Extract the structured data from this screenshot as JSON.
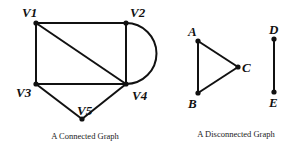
{
  "figure": {
    "connected": {
      "caption": "A Connected Graph",
      "nodes": [
        {
          "id": "V1",
          "label": "V1",
          "x": 36,
          "y": 23
        },
        {
          "id": "V2",
          "label": "V2",
          "x": 126,
          "y": 23
        },
        {
          "id": "V3",
          "label": "V3",
          "x": 36,
          "y": 84
        },
        {
          "id": "V4",
          "label": "V4",
          "x": 126,
          "y": 84
        },
        {
          "id": "V5",
          "label": "V5",
          "x": 82,
          "y": 119
        }
      ],
      "edges": [
        [
          "V1",
          "V2"
        ],
        [
          "V1",
          "V3"
        ],
        [
          "V1",
          "V4"
        ],
        [
          "V2",
          "V4"
        ],
        [
          "V2",
          "V4 (curved)"
        ],
        [
          "V3",
          "V4"
        ],
        [
          "V3",
          "V5"
        ],
        [
          "V4",
          "V5"
        ]
      ]
    },
    "disconnected": {
      "caption": "A Disconnected Graph",
      "nodes": [
        {
          "id": "A",
          "label": "A",
          "x": 198,
          "y": 41
        },
        {
          "id": "B",
          "label": "B",
          "x": 198,
          "y": 93
        },
        {
          "id": "C",
          "label": "C",
          "x": 238,
          "y": 67
        },
        {
          "id": "D",
          "label": "D",
          "x": 274,
          "y": 39
        },
        {
          "id": "E",
          "label": "E",
          "x": 274,
          "y": 92
        }
      ],
      "edges": [
        [
          "A",
          "B"
        ],
        [
          "A",
          "C"
        ],
        [
          "B",
          "C"
        ],
        [
          "D",
          "E"
        ]
      ]
    }
  }
}
